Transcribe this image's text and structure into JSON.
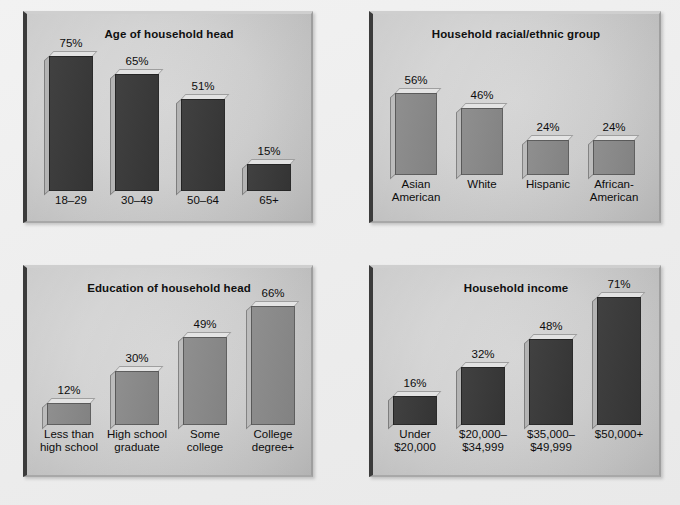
{
  "figure": {
    "background_color": "#eeeeee",
    "panel_background_color": "#d2d2d2",
    "bar_color_dark": "#3a3a3a",
    "bar_color_medium": "#888888",
    "value_suffix": "%"
  },
  "chart_data": [
    {
      "type": "bar",
      "title": "Age of household head",
      "xlabel": "",
      "ylabel": "",
      "ylim": [
        0,
        100
      ],
      "grid": false,
      "legend": "none",
      "bar_style": "dark",
      "categories": [
        "18–29",
        "30–49",
        "50–64",
        "65+"
      ],
      "category_lines": [
        [
          "18–29"
        ],
        [
          "30–49"
        ],
        [
          "50–64"
        ],
        [
          "65+"
        ]
      ],
      "values": [
        75,
        65,
        51,
        15
      ],
      "value_labels": [
        "75%",
        "65%",
        "51%",
        "15%"
      ]
    },
    {
      "type": "bar",
      "title": "Household racial/ethnic group",
      "xlabel": "",
      "ylabel": "",
      "ylim": [
        0,
        100
      ],
      "grid": false,
      "legend": "none",
      "bar_style": "medium",
      "categories": [
        "Asian American",
        "White",
        "Hispanic",
        "African-American"
      ],
      "category_lines": [
        [
          "Asian",
          "American"
        ],
        [
          "White"
        ],
        [
          "Hispanic"
        ],
        [
          "African-",
          "American"
        ]
      ],
      "values": [
        56,
        46,
        24,
        24
      ],
      "value_labels": [
        "56%",
        "46%",
        "24%",
        "24%"
      ]
    },
    {
      "type": "bar",
      "title": "Education of household head",
      "xlabel": "",
      "ylabel": "",
      "ylim": [
        0,
        100
      ],
      "grid": false,
      "legend": "none",
      "bar_style": "medium",
      "categories": [
        "Less than high school",
        "High school graduate",
        "Some college",
        "College degree+"
      ],
      "category_lines": [
        [
          "Less than",
          "high school"
        ],
        [
          "High school",
          "graduate"
        ],
        [
          "Some",
          "college"
        ],
        [
          "College",
          "degree+"
        ]
      ],
      "values": [
        12,
        30,
        49,
        66
      ],
      "value_labels": [
        "12%",
        "30%",
        "49%",
        "66%"
      ]
    },
    {
      "type": "bar",
      "title": "Household income",
      "xlabel": "",
      "ylabel": "",
      "ylim": [
        0,
        100
      ],
      "grid": false,
      "legend": "none",
      "bar_style": "dark",
      "categories": [
        "Under $20,000",
        "$20,000–$34,999",
        "$35,000–$49,999",
        "$50,000+"
      ],
      "category_lines": [
        [
          "Under",
          "$20,000"
        ],
        [
          "$20,000–",
          "$34,999"
        ],
        [
          "$35,000–",
          "$49,999"
        ],
        [
          "$50,000+"
        ]
      ],
      "values": [
        16,
        32,
        48,
        71
      ],
      "value_labels": [
        "16%",
        "32%",
        "48%",
        "71%"
      ]
    }
  ]
}
